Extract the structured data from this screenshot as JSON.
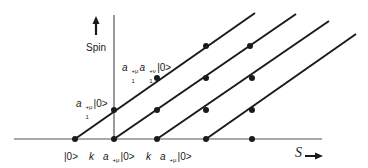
{
  "diagram": {
    "y_axis_label": "Spin",
    "x_axis_label": "S",
    "states": {
      "vacuum": "|0>",
      "k_a1": {
        "prefix": "k",
        "prefix_sub": "μ",
        "op": "a",
        "op_sup": "+μ",
        "op_sub": "1",
        "ket": "|0>"
      },
      "k_a2": {
        "prefix": "k",
        "prefix_sub": "μ",
        "op": "a",
        "op_sup": "+μ",
        "op_sub": "2",
        "ket": "|0>"
      },
      "a1": {
        "op": "a",
        "op_sup": "+μ",
        "op_sub": "1",
        "ket": "|0>"
      },
      "a1a1": {
        "op": "a",
        "op_sup": "+μ",
        "op_sub": "1",
        "op2": "a",
        "op2_sup": "+ν",
        "op2_sub": "1",
        "ket": "|0>"
      }
    },
    "colors": {
      "line": "#1a1a1a",
      "background": "#ffffff"
    },
    "trajectories": [
      {
        "from": [
          75,
          139
        ],
        "to": [
          255,
          13
        ],
        "dots": [
          [
            75,
            139
          ],
          [
            114,
            110
          ],
          [
            157,
            78
          ],
          [
            206,
            46
          ]
        ]
      },
      {
        "from": [
          114,
          139
        ],
        "to": [
          296,
          14
        ],
        "dots": [
          [
            114,
            139
          ],
          [
            157,
            110
          ],
          [
            206,
            78
          ],
          [
            250,
            46
          ]
        ]
      },
      {
        "from": [
          157,
          139
        ],
        "to": [
          329,
          21
        ],
        "dots": [
          [
            157,
            139
          ],
          [
            206,
            110
          ],
          [
            252,
            78
          ]
        ]
      },
      {
        "from": [
          206,
          139
        ],
        "to": [
          356,
          34
        ],
        "dots": [
          [
            206,
            139
          ],
          [
            252,
            110
          ]
        ]
      }
    ],
    "extra_dots": [
      [
        252,
        139
      ]
    ]
  }
}
